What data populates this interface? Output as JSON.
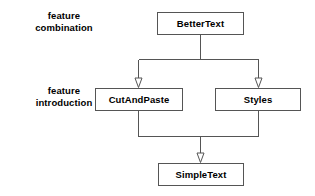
{
  "diagram": {
    "type": "uml-generalization",
    "background_color": "#ffffff",
    "line_color": "#555555",
    "text_color": "#000000",
    "row_labels": [
      {
        "id": "feature-combination",
        "line1": "feature",
        "line2": "combination"
      },
      {
        "id": "feature-introduction",
        "line1": "feature",
        "line2": "introduction"
      }
    ],
    "nodes": [
      {
        "id": "better-text",
        "label": "BetterText"
      },
      {
        "id": "cut-and-paste",
        "label": "CutAndPaste"
      },
      {
        "id": "styles",
        "label": "Styles"
      },
      {
        "id": "simple-text",
        "label": "SimpleText"
      }
    ],
    "edges": [
      {
        "id": "better-text-to-cut-and-paste",
        "from": "BetterText",
        "to": "CutAndPaste",
        "arrow": "hollow-triangle"
      },
      {
        "id": "better-text-to-styles",
        "from": "BetterText",
        "to": "Styles",
        "arrow": "hollow-triangle"
      },
      {
        "id": "cut-and-paste-to-simple-text",
        "from": "CutAndPaste",
        "to": "SimpleText",
        "arrow": "hollow-triangle"
      },
      {
        "id": "styles-to-simple-text",
        "from": "Styles",
        "to": "SimpleText",
        "arrow": "hollow-triangle"
      }
    ]
  }
}
